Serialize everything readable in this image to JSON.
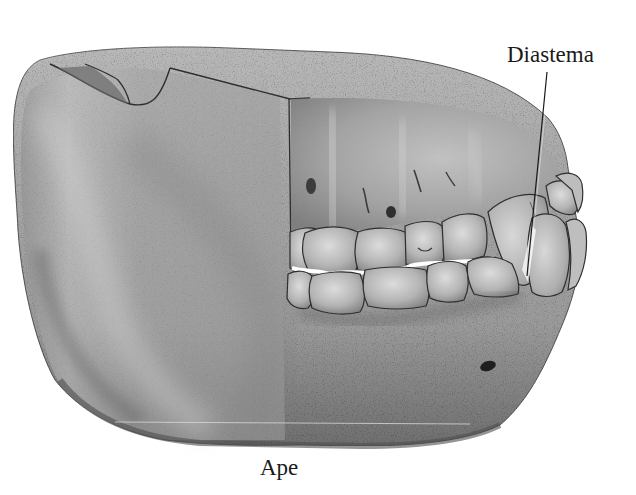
{
  "figure": {
    "style": "grayscale stippled anatomical illustration",
    "caption": "Ape",
    "labels": [
      {
        "text": "Diastema",
        "points_to": "gap between lower canine and adjacent tooth",
        "leader_line": true
      }
    ],
    "colors": {
      "background": "#ffffff",
      "bone_light": "#c9c9c9",
      "bone_mid": "#9c9c9c",
      "bone_dark": "#5e5e5e",
      "outline": "#2a2a2a",
      "tooth_light": "#d4d4d4",
      "tooth_mid": "#a8a8a8",
      "text": "#1a1a1a"
    }
  }
}
